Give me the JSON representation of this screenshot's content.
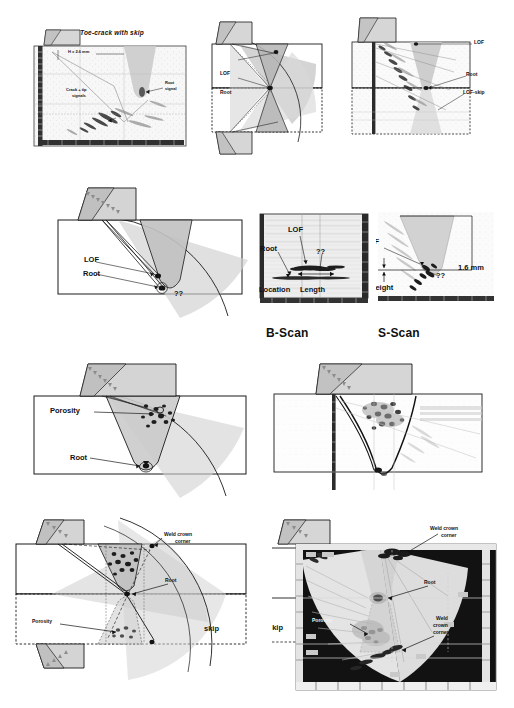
{
  "figure": {
    "type": "paut-weld-inspection-composite",
    "rows": 4,
    "colors": {
      "outline": "#1a1a1a",
      "beam_light": "#d9d9d9",
      "beam_mid": "#bfbfbf",
      "beam_dark": "#a6a6a6",
      "weld_fill": "#c8c8c8",
      "wedge_fill": "#cfcfcf",
      "scan_dark": "#121212",
      "scan_light": "#ededed",
      "text": "#111111",
      "text_light": "#f2f2f2"
    }
  },
  "row1": {
    "panel_a": {
      "name": "toe-crack-with-skip-scan",
      "title": "Toe-crack with skip",
      "dimension_label": "H    = 2.6 mm",
      "dimension_sub": "ind",
      "labels": {
        "root_signal": "Root\nsignal",
        "root_signal_line1": "Root",
        "root_signal_line2": "signal",
        "crack_signals_line1": "Crack + tip",
        "crack_signals_line2": "signals"
      }
    },
    "panel_b": {
      "name": "tandem-skip-coverage-schematic",
      "labels": {
        "lof": "LOF",
        "root": "Root"
      }
    },
    "panel_c": {
      "name": "lof-skip-scan",
      "labels": {
        "lof": "LOF",
        "root": "Root",
        "lof_skip": "LOF-skip"
      }
    }
  },
  "row2": {
    "panel_a": {
      "name": "lof-root-beam-schematic",
      "labels": {
        "lof": "LOF",
        "root": "Root",
        "unknown": "??"
      }
    },
    "panel_b": {
      "name": "b-scan-image",
      "caption": "B-Scan",
      "labels": {
        "lof": "LOF",
        "root": "Root",
        "unknown": "??",
        "location": "Location",
        "length": "Length"
      }
    },
    "panel_c": {
      "name": "s-scan-image",
      "caption": "S-Scan",
      "labels": {
        "lof": "LOF",
        "height": "Height",
        "measurement": "1.6 mm",
        "unknown": "??"
      }
    }
  },
  "row3": {
    "panel_a": {
      "name": "porosity-root-schematic",
      "labels": {
        "porosity": "Porosity",
        "root": "Root"
      }
    },
    "panel_b": {
      "name": "porosity-root-s-scan",
      "labels": {}
    }
  },
  "row4": {
    "panel_a": {
      "name": "porosity-skip-schematic",
      "labels": {
        "weld_crown_corner_line1": "Weld crown",
        "weld_crown_corner_line2": "corner",
        "root": "Root",
        "porosity": "Porosity",
        "skip": "skip"
      }
    },
    "panel_b": {
      "name": "porosity-skip-s-scan",
      "labels": {
        "weld_crown_corner_line1": "Weld crown",
        "weld_crown_corner_line2": "corner",
        "weld_crown_corner2_line1": "Weld",
        "weld_crown_corner2_line2": "crown",
        "weld_crown_corner2_line3": "corner",
        "root": "Root",
        "porosity": "Porosity",
        "skip": "skip"
      }
    }
  }
}
